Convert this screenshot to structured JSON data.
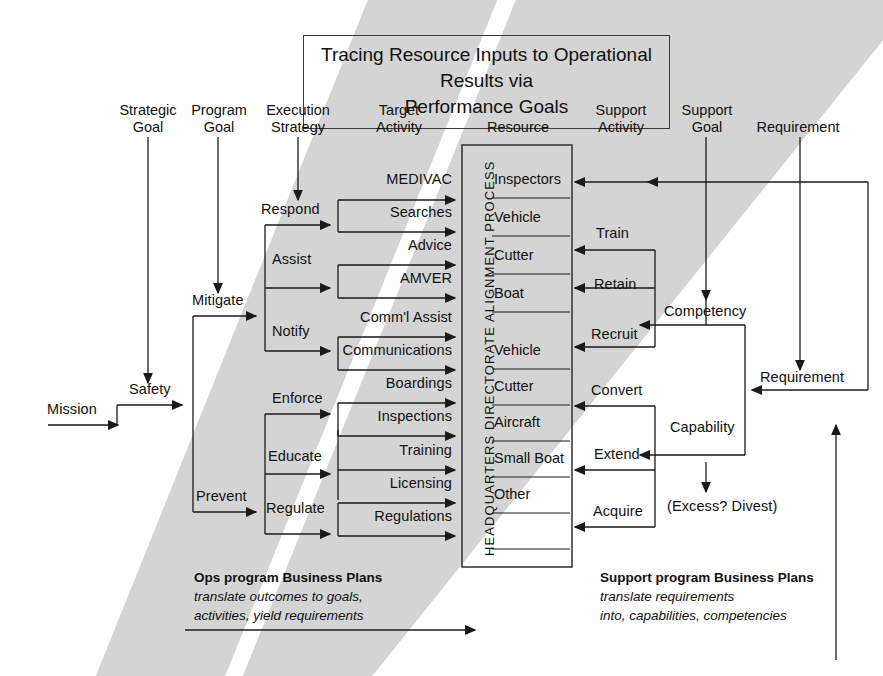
{
  "title": {
    "line1": "Tracing Resource Inputs to Operational Results via",
    "line2": "Performance Goals"
  },
  "columns": [
    {
      "name": "strategic-goal",
      "label": "Strategic\nGoal"
    },
    {
      "name": "program-goal",
      "label": "Program\nGoal"
    },
    {
      "name": "execution-strategy",
      "label": "Execution\nStrategy"
    },
    {
      "name": "target-activity",
      "label": "Target\nActivity"
    },
    {
      "name": "resource",
      "label": "Resource"
    },
    {
      "name": "support-activity",
      "label": "Support\nActivity"
    },
    {
      "name": "support-goal",
      "label": "Support\nGoal"
    },
    {
      "name": "requirement",
      "label": "Requirement"
    }
  ],
  "flow": {
    "mission": "Mission",
    "strategic_goal_value": "Safety",
    "program_goals": [
      "Mitigate",
      "Prevent"
    ],
    "execution_strategies": [
      "Respond",
      "Assist",
      "Notify",
      "Enforce",
      "Educate",
      "Regulate"
    ],
    "target_activities": [
      "MEDIVAC",
      "Searches",
      "Advice",
      "AMVER",
      "Comm'l Assist",
      "Communications",
      "Boardings",
      "Inspections",
      "Training",
      "Licensing",
      "Regulations"
    ],
    "resources": [
      "Inspectors",
      "Vehicle",
      "Cutter",
      "Boat",
      "Vehicle",
      "Cutter",
      "Aircraft",
      "Small Boat",
      "Other"
    ],
    "support_activities": [
      "Train",
      "Retain",
      "Recruit",
      "Convert",
      "Extend",
      "Acquire"
    ],
    "support_goals": [
      "Competency",
      "Capability"
    ],
    "requirement_label": "Requirement",
    "divest_note": "(Excess? Divest)"
  },
  "center_box": {
    "vertical_label": "HEADQUARTERS DIRECTORATE ALIGNMENT PROCESS"
  },
  "notes": {
    "ops": {
      "heading": "Ops program Business Plans",
      "line1": "translate outcomes to goals,",
      "line2": "activities, yield requirements"
    },
    "support": {
      "heading": "Support program Business Plans",
      "line1": "translate requirements",
      "line2": "into, capabilities, competencies"
    }
  },
  "colors": {
    "band": "#d4d4d4",
    "ink": "#1a1a1a",
    "box_border": "#3a3a3a"
  }
}
